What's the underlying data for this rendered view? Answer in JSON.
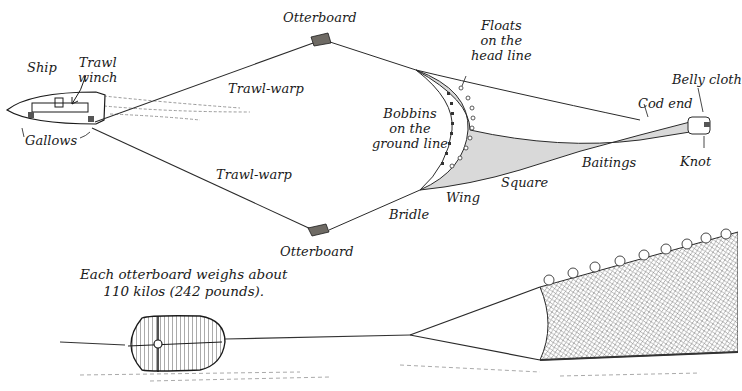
{
  "diagram": {
    "labels": {
      "ship": "Ship",
      "trawl_winch": [
        "Trawl",
        "winch"
      ],
      "gallows": "Gallows",
      "trawl_warp_upper": "Trawl-warp",
      "trawl_warp_lower": "Trawl-warp",
      "otterboard_upper": "Otterboard",
      "otterboard_lower": "Otterboard",
      "floats": [
        "Floats",
        "on the",
        "head line"
      ],
      "bobbins": [
        "Bobbins",
        "on the",
        "ground line"
      ],
      "bridle": "Bridle",
      "wing": "Wing",
      "square": "Square",
      "baitings": "Baitings",
      "cod_end": "Cod end",
      "belly_cloth": "Belly cloth",
      "knot": "Knot"
    },
    "caption": [
      "Each otterboard weighs about",
      "110 kilos (242 pounds)."
    ],
    "colors": {
      "ink": "#1a1a1a",
      "net_shade": "#b8b8b8",
      "board_fill": "#6e6a64",
      "wake": "#9a9a9a"
    }
  }
}
